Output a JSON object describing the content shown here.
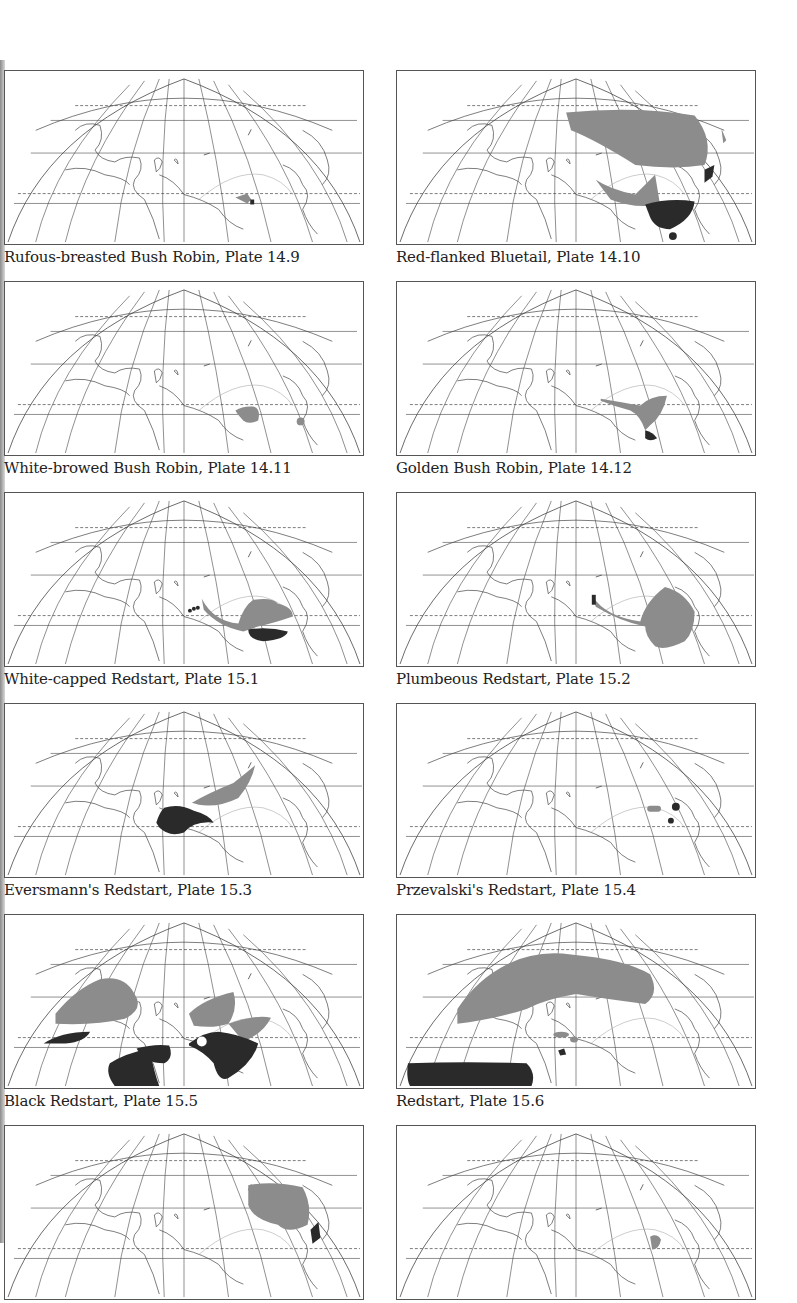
{
  "page": {
    "background": "#ffffff",
    "colors": {
      "range_light": "#8c8c8c",
      "range_dark": "#2a2a2a",
      "outline": "#444444"
    }
  },
  "maps": [
    {
      "caption": "Rufous-breasted Bush Robin, Plate 14.9",
      "species": "Rufous-breasted Bush Robin",
      "plate": "14.9"
    },
    {
      "caption": "Red-flanked Bluetail, Plate 14.10",
      "species": "Red-flanked Bluetail",
      "plate": "14.10"
    },
    {
      "caption": "White-browed Bush Robin, Plate 14.11",
      "species": "White-browed Bush Robin",
      "plate": "14.11"
    },
    {
      "caption": "Golden Bush Robin, Plate 14.12",
      "species": "Golden Bush Robin",
      "plate": "14.12"
    },
    {
      "caption": "White-capped Redstart, Plate 15.1",
      "species": "White-capped Redstart",
      "plate": "15.1"
    },
    {
      "caption": "Plumbeous Redstart, Plate 15.2",
      "species": "Plumbeous Redstart",
      "plate": "15.2"
    },
    {
      "caption": "Eversmann's Redstart, Plate 15.3",
      "species": "Eversmann's Redstart",
      "plate": "15.3"
    },
    {
      "caption": "Przevalski's Redstart, Plate 15.4",
      "species": "Przevalski's Redstart",
      "plate": "15.4"
    },
    {
      "caption": "Black Redstart, Plate 15.5",
      "species": "Black Redstart",
      "plate": "15.5"
    },
    {
      "caption": "Redstart, Plate 15.6",
      "species": "Redstart",
      "plate": "15.6"
    },
    {
      "caption": "",
      "species": "",
      "plate": ""
    },
    {
      "caption": "",
      "species": "",
      "plate": ""
    }
  ]
}
